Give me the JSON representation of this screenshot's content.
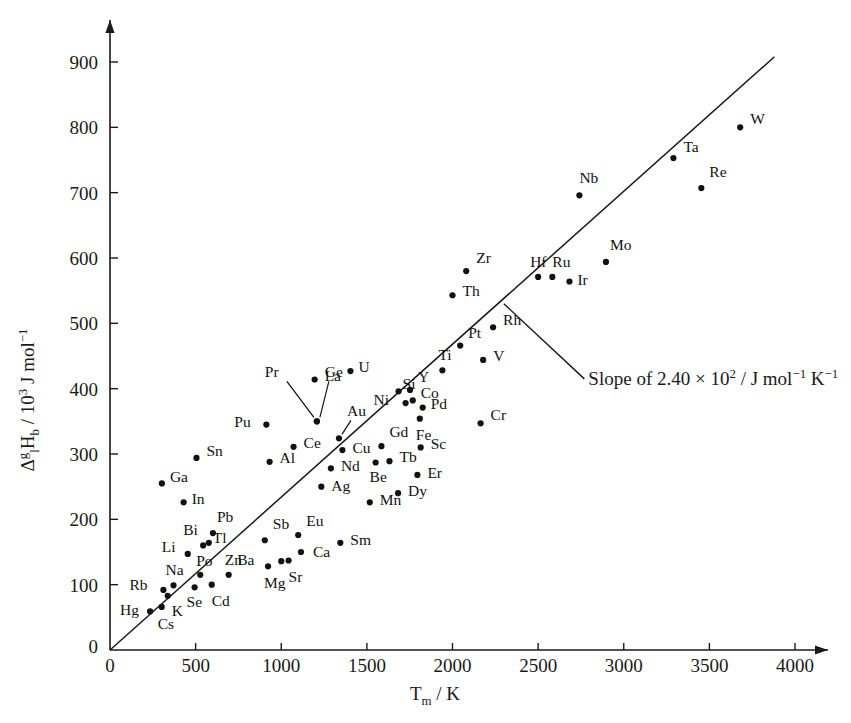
{
  "chart_data": {
    "type": "scatter",
    "title": "",
    "xlabel": "T_m / K",
    "ylabel": "Δ_l^g H_b / 10^3 J mol^-1",
    "xlabel_parts": {
      "main": "T",
      "sub": "m",
      "tail": " / K"
    },
    "ylabel_parts": {
      "delta": "Δ",
      "delta_sup": "g",
      "delta_sub": "l",
      "h": "H",
      "h_sub": "b",
      "tail": " / 10",
      "tail_sup": "3",
      "tail2": " J mol",
      "tail2_sup": "−1"
    },
    "xlim": [
      0,
      4200
    ],
    "ylim": [
      0,
      960
    ],
    "xticks": [
      0,
      500,
      1000,
      1500,
      2000,
      2500,
      3000,
      3500,
      4000
    ],
    "yticks": [
      0,
      100,
      200,
      300,
      400,
      500,
      600,
      700,
      800,
      900
    ],
    "grid": false,
    "legend": "none",
    "axis_arrows": true,
    "origin_label": "0",
    "annotation": {
      "text_pre": "Slope of 2.40 × 10",
      "text_sup": "2",
      "text_mid": " / J mol",
      "text_sup2": "−1",
      "text_post": " K",
      "text_sup3": "−1",
      "full": "Slope of 2.40 × 10² / J mol⁻¹ K⁻¹",
      "leader_from": [
        2300,
        530
      ],
      "leader_to": [
        2770,
        415
      ]
    },
    "trendline": {
      "slope_per_K": 0.24,
      "intercept": 0,
      "x_start": 0,
      "y_start": 0,
      "x_end": 3880,
      "y_end": 908
    },
    "points": [
      {
        "el": "Hg",
        "x": 234,
        "y": 59,
        "lx": -30,
        "ly": 4
      },
      {
        "el": "Cs",
        "x": 302,
        "y": 66,
        "lx": -4,
        "ly": 22
      },
      {
        "el": "K",
        "x": 337,
        "y": 83,
        "lx": 4,
        "ly": 20
      },
      {
        "el": "Rb",
        "x": 312,
        "y": 92,
        "lx": -34,
        "ly": 0
      },
      {
        "el": "Na",
        "x": 371,
        "y": 99,
        "lx": -8,
        "ly": -10
      },
      {
        "el": "Se",
        "x": 494,
        "y": 96,
        "lx": -8,
        "ly": 20
      },
      {
        "el": "Po",
        "x": 527,
        "y": 115,
        "lx": -4,
        "ly": -9
      },
      {
        "el": "Cd",
        "x": 594,
        "y": 100,
        "lx": 0,
        "ly": 21
      },
      {
        "el": "Zn",
        "x": 693,
        "y": 115,
        "lx": -4,
        "ly": -10
      },
      {
        "el": "Mg",
        "x": 923,
        "y": 128,
        "lx": -4,
        "ly": 22
      },
      {
        "el": "Ba",
        "x": 1000,
        "y": 136,
        "lx": -44,
        "ly": 4
      },
      {
        "el": "Sr",
        "x": 1043,
        "y": 137,
        "lx": 0,
        "ly": 22
      },
      {
        "el": "Ca",
        "x": 1115,
        "y": 150,
        "lx": 12,
        "ly": 5
      },
      {
        "el": "Li",
        "x": 454,
        "y": 147,
        "lx": -26,
        "ly": -2
      },
      {
        "el": "Bi",
        "x": 544,
        "y": 160,
        "lx": -20,
        "ly": -10
      },
      {
        "el": "Tl",
        "x": 577,
        "y": 164,
        "lx": 4,
        "ly": 0
      },
      {
        "el": "Pb",
        "x": 601,
        "y": 179,
        "lx": 4,
        "ly": -11
      },
      {
        "el": "Sb",
        "x": 904,
        "y": 168,
        "lx": 8,
        "ly": -11
      },
      {
        "el": "Eu",
        "x": 1099,
        "y": 176,
        "lx": 8,
        "ly": -9
      },
      {
        "el": "Sm",
        "x": 1345,
        "y": 164,
        "lx": 10,
        "ly": 2
      },
      {
        "el": "In",
        "x": 430,
        "y": 226,
        "lx": 8,
        "ly": 2
      },
      {
        "el": "Ga",
        "x": 303,
        "y": 255,
        "lx": 8,
        "ly": -1
      },
      {
        "el": "Ag",
        "x": 1234,
        "y": 250,
        "lx": 10,
        "ly": 4
      },
      {
        "el": "Mn",
        "x": 1517,
        "y": 226,
        "lx": 10,
        "ly": 3
      },
      {
        "el": "Dy",
        "x": 1682,
        "y": 240,
        "lx": 10,
        "ly": 3
      },
      {
        "el": "Sn",
        "x": 505,
        "y": 294,
        "lx": 10,
        "ly": -2
      },
      {
        "el": "Al",
        "x": 932,
        "y": 288,
        "lx": 10,
        "ly": 1
      },
      {
        "el": "Nd",
        "x": 1290,
        "y": 278,
        "lx": 10,
        "ly": 3
      },
      {
        "el": "Be",
        "x": 1551,
        "y": 287,
        "lx": -6,
        "ly": 20
      },
      {
        "el": "Tb",
        "x": 1632,
        "y": 289,
        "lx": 10,
        "ly": 1
      },
      {
        "el": "Er",
        "x": 1795,
        "y": 268,
        "lx": 10,
        "ly": 3
      },
      {
        "el": "Cu",
        "x": 1357,
        "y": 306,
        "lx": 10,
        "ly": 3
      },
      {
        "el": "Ce",
        "x": 1072,
        "y": 311,
        "lx": 10,
        "ly": 1
      },
      {
        "el": "Gd",
        "x": 1585,
        "y": 312,
        "lx": 8,
        "ly": -9
      },
      {
        "el": "Sc",
        "x": 1814,
        "y": 310,
        "lx": 10,
        "ly": 2
      },
      {
        "el": "Cr",
        "x": 2164,
        "y": 347,
        "lx": 10,
        "ly": -3
      },
      {
        "el": "Pu",
        "x": 913,
        "y": 345,
        "lx": -32,
        "ly": 2
      },
      {
        "el": "Au",
        "x": 1337,
        "y": 324,
        "lx": 8,
        "ly": -22,
        "arrow": true
      },
      {
        "el": "Fe",
        "x": 1809,
        "y": 354,
        "lx": -4,
        "ly": 21
      },
      {
        "el": "Pd",
        "x": 1826,
        "y": 371,
        "lx": 8,
        "ly": 1
      },
      {
        "el": "Co",
        "x": 1768,
        "y": 382,
        "lx": 8,
        "ly": -2
      },
      {
        "el": "Ni",
        "x": 1726,
        "y": 378,
        "lx": -32,
        "ly": 2
      },
      {
        "el": "Si",
        "x": 1685,
        "y": 396,
        "lx": 4,
        "ly": -2
      },
      {
        "el": "Y",
        "x": 1752,
        "y": 398,
        "lx": 8,
        "ly": -8
      },
      {
        "el": "La",
        "x": 1195,
        "y": 414,
        "lx": 10,
        "ly": 1
      },
      {
        "el": "Pr",
        "x": 1208,
        "y": 350,
        "lx": -52,
        "ly": -44,
        "arrow": true
      },
      {
        "el": "Ge",
        "x": 1208,
        "y": 350,
        "lx": 8,
        "ly": -44,
        "arrow": true
      },
      {
        "el": "U",
        "x": 1404,
        "y": 427,
        "lx": 8,
        "ly": 1
      },
      {
        "el": "Ti",
        "x": 1941,
        "y": 428,
        "lx": -4,
        "ly": -10
      },
      {
        "el": "V",
        "x": 2179,
        "y": 444,
        "lx": 10,
        "ly": 1
      },
      {
        "el": "Pt",
        "x": 2045,
        "y": 466,
        "lx": 8,
        "ly": -8
      },
      {
        "el": "Rh",
        "x": 2237,
        "y": 494,
        "lx": 10,
        "ly": -2
      },
      {
        "el": "Th",
        "x": 2000,
        "y": 543,
        "lx": 10,
        "ly": 1
      },
      {
        "el": "Zr",
        "x": 2080,
        "y": 580,
        "lx": 10,
        "ly": -8
      },
      {
        "el": "Hf",
        "x": 2500,
        "y": 571,
        "lx": -8,
        "ly": -10
      },
      {
        "el": "Ru",
        "x": 2583,
        "y": 571,
        "lx": 0,
        "ly": -10
      },
      {
        "el": "Ir",
        "x": 2683,
        "y": 564,
        "lx": 8,
        "ly": 3
      },
      {
        "el": "Mo",
        "x": 2896,
        "y": 594,
        "lx": 4,
        "ly": -12
      },
      {
        "el": "Nb",
        "x": 2741,
        "y": 696,
        "lx": 0,
        "ly": -12
      },
      {
        "el": "Ta",
        "x": 3290,
        "y": 753,
        "lx": 10,
        "ly": -6
      },
      {
        "el": "Re",
        "x": 3453,
        "y": 707,
        "lx": 8,
        "ly": -11
      },
      {
        "el": "W",
        "x": 3680,
        "y": 800,
        "lx": 10,
        "ly": -3
      }
    ]
  }
}
